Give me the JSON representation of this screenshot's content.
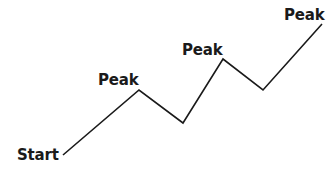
{
  "diagram": {
    "title": "",
    "line_color": "#1a1a1a",
    "background": "#ffffff",
    "points": [
      {
        "x": 63,
        "y": 155
      },
      {
        "x": 139,
        "y": 90
      },
      {
        "x": 183,
        "y": 123
      },
      {
        "x": 223,
        "y": 59
      },
      {
        "x": 263,
        "y": 90
      },
      {
        "x": 322,
        "y": 24
      }
    ],
    "labels": [
      {
        "text": "Start",
        "x": 17,
        "y": 148
      },
      {
        "text": "Peak",
        "x": 98,
        "y": 73
      },
      {
        "text": "Peak",
        "x": 182,
        "y": 43
      },
      {
        "text": "Peak",
        "x": 284,
        "y": 8
      }
    ]
  }
}
